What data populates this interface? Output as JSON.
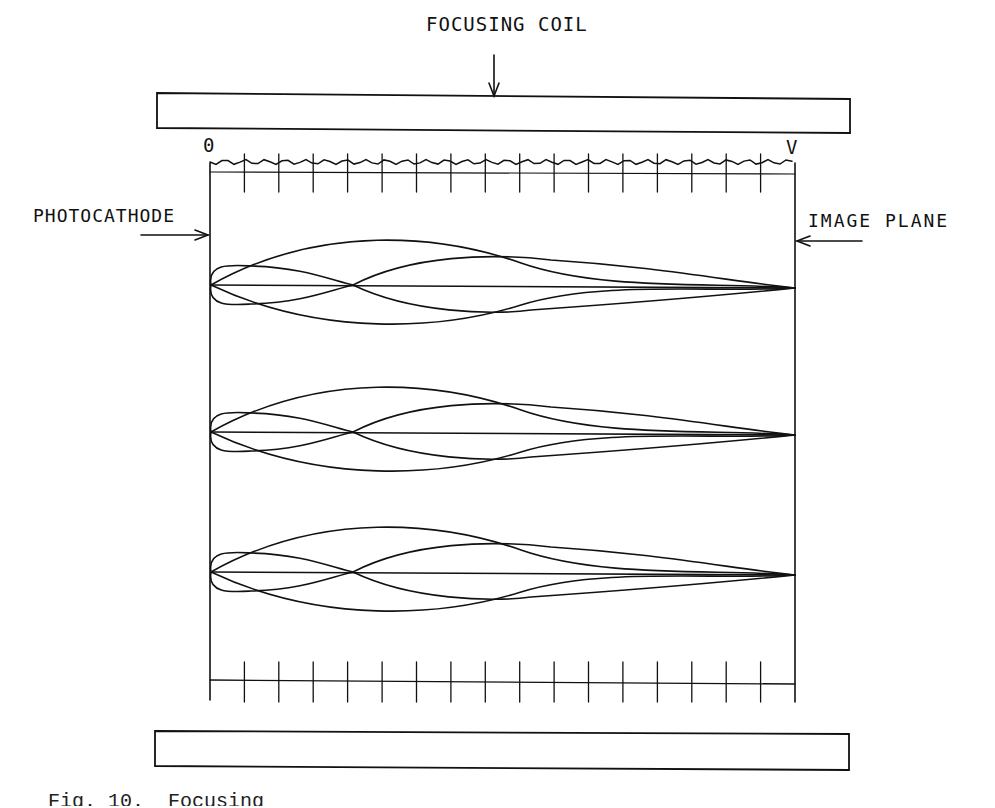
{
  "labels": {
    "focusing_coil": "FOCUSING COIL",
    "photocathode": "PHOTOCATHODE",
    "image_plane": "IMAGE PLANE",
    "potential_start": "0",
    "potential_end": "V"
  },
  "caption": "Fig. 10.  Focusing",
  "geometry": {
    "top_coil": {
      "x": 157,
      "y": 93,
      "w": 550,
      "h": 35
    },
    "bottom_coil": {
      "x": 155,
      "y": 731,
      "w": 695,
      "h": 38
    },
    "photocathode_x": 210,
    "image_plane_x": 795,
    "top_scale_y": 172,
    "bottom_scale_y": 680,
    "tick_count": 16,
    "ray_bundles_y": [
      285,
      432,
      572
    ]
  },
  "colors": {
    "ink": "#111111",
    "paper": "#ffffff"
  }
}
